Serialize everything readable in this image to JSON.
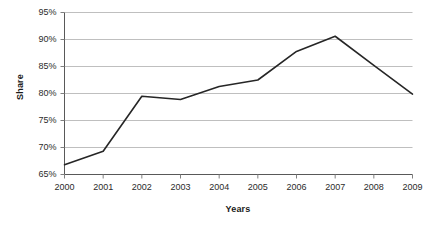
{
  "chart_data": {
    "type": "line",
    "title": "",
    "xlabel": "Years",
    "ylabel": "Share",
    "categories": [
      "2000",
      "2001",
      "2002",
      "2003",
      "2004",
      "2005",
      "2006",
      "2007",
      "2008",
      "2009"
    ],
    "series": [
      {
        "name": "Share",
        "values": [
          66.8,
          69.3,
          79.5,
          78.9,
          81.3,
          82.5,
          87.8,
          90.6,
          85.2,
          79.9
        ]
      }
    ],
    "ylim": [
      65,
      95
    ],
    "y_ticks": [
      65,
      70,
      75,
      80,
      85,
      90,
      95
    ],
    "y_tick_labels": [
      "65%",
      "70%",
      "75%",
      "80%",
      "85%",
      "90%",
      "95%"
    ],
    "x_tick_labels": [
      "2000",
      "2001",
      "2002",
      "2003",
      "2004",
      "2005",
      "2006",
      "2007",
      "2008",
      "2009"
    ],
    "grid": true,
    "grid_axis": "y",
    "legend": false,
    "legend_position": "none",
    "line_color": "#262626",
    "grid_color": "#bfbfbf",
    "axis_color": "#808080",
    "background_color": "#ffffff",
    "markers": false
  },
  "axes": {
    "y_title": "Share",
    "x_title": "Years"
  }
}
